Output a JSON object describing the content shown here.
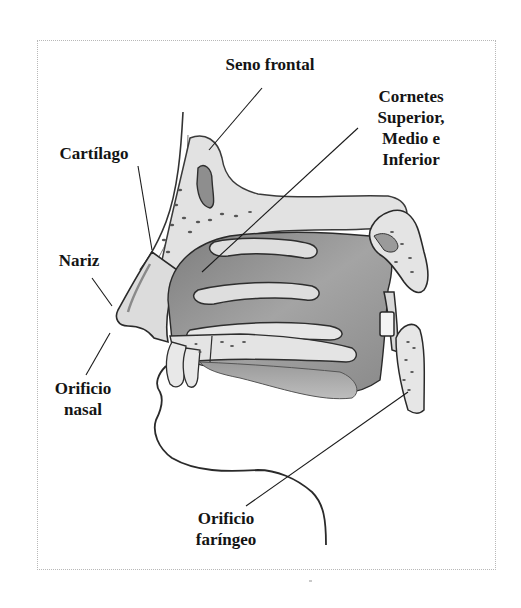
{
  "diagram": {
    "labels": {
      "seno_frontal": "Seno frontal",
      "cornetes": {
        "line1": "Cornetes",
        "line2": "Superior,",
        "line3": "Medio e",
        "line4": "Inferior"
      },
      "cartilago": "Cartílago",
      "nariz": "Nariz",
      "orificio_nasal": {
        "line1": "Orificio",
        "line2": "nasal"
      },
      "orificio_faringeo": {
        "line1": "Orificio",
        "line2": "faríngeo"
      }
    },
    "colors": {
      "text": "#141414",
      "line": "#1a1a1a",
      "cavity_dark": "#8c8c8c",
      "cavity_mid": "#a9a9a9",
      "bone_fill": "#e4e4e4",
      "frame_border": "#b8b8b8"
    }
  }
}
